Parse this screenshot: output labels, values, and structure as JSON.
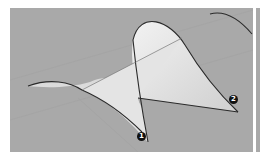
{
  "viewport": {
    "background": "#a9a9a9",
    "surface_color": "#e8e8e8",
    "curve_color": "#2a2a2a"
  },
  "markers": [
    {
      "label": "1",
      "x": 141,
      "y": 136
    },
    {
      "label": "2",
      "x": 233,
      "y": 99
    }
  ]
}
